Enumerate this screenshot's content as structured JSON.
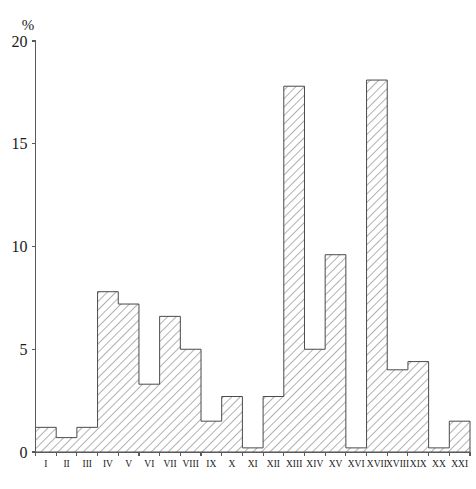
{
  "chart_data": {
    "type": "bar",
    "title": "",
    "subtitle": "",
    "xlabel": "",
    "ylabel": "%",
    "ylim": [
      0,
      20
    ],
    "yticks": [
      0,
      5,
      10,
      15,
      20
    ],
    "ytick_labels": [
      "0",
      "5",
      "10",
      "15",
      "20"
    ],
    "grid": false,
    "legend": false,
    "bar_style": "diagonal-hatch",
    "categories": [
      "I",
      "II",
      "III",
      "IV",
      "V",
      "VI",
      "VII",
      "VIII",
      "IX",
      "X",
      "XI",
      "XII",
      "XIII",
      "XIV",
      "XV",
      "XVI",
      "XVII",
      "XVIII",
      "XIX",
      "XX",
      "XXI"
    ],
    "values": [
      1.2,
      0.7,
      1.2,
      7.8,
      7.2,
      3.3,
      6.6,
      5.0,
      1.5,
      2.7,
      0.2,
      2.7,
      17.8,
      5.0,
      9.6,
      0.2,
      18.1,
      4.0,
      4.4,
      0.2,
      1.5
    ],
    "value_unit": "%"
  },
  "axes": {
    "y_unit_label": "%",
    "y_tick_labels": [
      "20",
      "15",
      "10",
      "5",
      "0"
    ],
    "x_tick_labels": [
      "I",
      "II",
      "III",
      "IV",
      "V",
      "VI",
      "VII",
      "VIII",
      "IX",
      "X",
      "XI",
      "XII",
      "XIII",
      "XIV",
      "XV",
      "XVI",
      "XVII",
      "XVIII",
      "XIX",
      "XX",
      "XXI"
    ]
  },
  "caption": {
    "text": ""
  }
}
